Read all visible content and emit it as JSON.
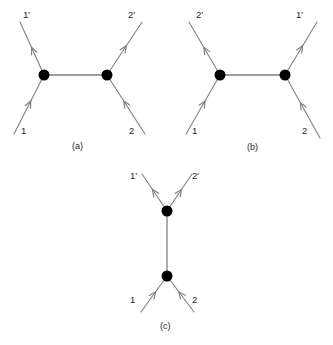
{
  "figure": {
    "type": "feynman-diagram-set",
    "background_color": "#ffffff",
    "line_color": "#808080",
    "vertex_color": "#000000",
    "text_color": "#231f20",
    "width": 333,
    "height": 345
  },
  "panels": [
    {
      "id": "a",
      "caption": "(a)",
      "caption_x": 72,
      "caption_y": 142,
      "topology": "horizontal-propagator",
      "vertices": [
        {
          "name": "left-vertex",
          "x": 44,
          "y": 75,
          "r": 5.5
        },
        {
          "name": "right-vertex",
          "x": 107,
          "y": 75,
          "r": 5.5
        }
      ],
      "propagator": {
        "x1": 44,
        "y1": 75,
        "x2": 107,
        "y2": 75
      },
      "legs": [
        {
          "name": "leg-1-prime",
          "label": "1'",
          "direction": "outgoing",
          "from_x": 44,
          "from_y": 75,
          "to_x": 20,
          "to_y": 22,
          "arrow_t": 0.52,
          "label_x": 23,
          "label_y": 10
        },
        {
          "name": "leg-2-prime",
          "label": "2'",
          "direction": "outgoing",
          "from_x": 107,
          "from_y": 75,
          "to_x": 142,
          "to_y": 22,
          "arrow_t": 0.55,
          "label_x": 128,
          "label_y": 10
        },
        {
          "name": "leg-1",
          "label": "1",
          "direction": "incoming",
          "from_x": 14,
          "from_y": 134,
          "to_x": 44,
          "to_y": 75,
          "arrow_t": 0.56,
          "label_x": 21,
          "label_y": 126
        },
        {
          "name": "leg-2",
          "label": "2",
          "direction": "incoming",
          "from_x": 145,
          "from_y": 134,
          "to_x": 107,
          "to_y": 75,
          "arrow_t": 0.56,
          "label_x": 129,
          "label_y": 126
        }
      ]
    },
    {
      "id": "b",
      "caption": "(b)",
      "caption_x": 247,
      "caption_y": 143,
      "topology": "horizontal-propagator",
      "vertices": [
        {
          "name": "left-vertex",
          "x": 220,
          "y": 75,
          "r": 5.5
        },
        {
          "name": "right-vertex",
          "x": 285,
          "y": 75,
          "r": 5.5
        }
      ],
      "propagator": {
        "x1": 220,
        "y1": 75,
        "x2": 285,
        "y2": 75
      },
      "legs": [
        {
          "name": "leg-2-prime",
          "label": "2'",
          "direction": "outgoing",
          "from_x": 220,
          "from_y": 75,
          "to_x": 189,
          "to_y": 22,
          "arrow_t": 0.52,
          "label_x": 196,
          "label_y": 10
        },
        {
          "name": "leg-1-prime",
          "label": "1'",
          "direction": "outgoing",
          "from_x": 285,
          "from_y": 75,
          "to_x": 317,
          "to_y": 22,
          "arrow_t": 0.55,
          "label_x": 296,
          "label_y": 10
        },
        {
          "name": "leg-1",
          "label": "1",
          "direction": "incoming",
          "from_x": 186,
          "from_y": 134,
          "to_x": 220,
          "to_y": 75,
          "arrow_t": 0.56,
          "label_x": 192,
          "label_y": 126
        },
        {
          "name": "leg-2",
          "label": "2",
          "direction": "incoming",
          "from_x": 320,
          "from_y": 138,
          "to_x": 285,
          "to_y": 75,
          "arrow_t": 0.56,
          "label_x": 302,
          "label_y": 126
        }
      ]
    },
    {
      "id": "c",
      "caption": "(c)",
      "caption_x": 160,
      "caption_y": 322,
      "topology": "vertical-propagator",
      "vertices": [
        {
          "name": "top-vertex",
          "x": 167,
          "y": 211,
          "r": 5.5
        },
        {
          "name": "bottom-vertex",
          "x": 167,
          "y": 276,
          "r": 5.5
        }
      ],
      "propagator": {
        "x1": 167,
        "y1": 211,
        "x2": 167,
        "y2": 276
      },
      "legs": [
        {
          "name": "leg-1-prime",
          "label": "1'",
          "direction": "outgoing",
          "from_x": 167,
          "from_y": 211,
          "to_x": 142,
          "to_y": 174,
          "arrow_t": 0.58,
          "label_x": 130,
          "label_y": 171
        },
        {
          "name": "leg-2-prime",
          "label": "2'",
          "direction": "outgoing",
          "from_x": 167,
          "from_y": 211,
          "to_x": 192,
          "to_y": 174,
          "arrow_t": 0.58,
          "label_x": 192,
          "label_y": 171
        },
        {
          "name": "leg-1",
          "label": "1",
          "direction": "incoming",
          "from_x": 141,
          "from_y": 312,
          "to_x": 167,
          "to_y": 276,
          "arrow_t": 0.56,
          "label_x": 130,
          "label_y": 295
        },
        {
          "name": "leg-2",
          "label": "2",
          "direction": "incoming",
          "from_x": 194,
          "from_y": 312,
          "to_x": 167,
          "to_y": 276,
          "arrow_t": 0.56,
          "label_x": 192,
          "label_y": 295
        }
      ]
    }
  ]
}
